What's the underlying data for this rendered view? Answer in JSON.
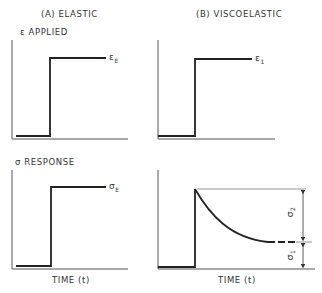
{
  "columns": {
    "elastic": {
      "title": "(A) ELASTIC"
    },
    "viscoelastic": {
      "title": "(B) VISCOELASTIC"
    }
  },
  "rows": {
    "applied": {
      "label": "ε APPLIED"
    },
    "response": {
      "label": "σ RESPONSE"
    }
  },
  "annotations": {
    "eps_E": {
      "sym": "ε",
      "sub": "E"
    },
    "eps_1": {
      "sym": "ε",
      "sub": "1"
    },
    "sigma_E": {
      "sym": "σ",
      "sub": "E"
    },
    "sigma_1": {
      "sym": "σ",
      "sub": "1"
    },
    "sigma_2": {
      "sym": "σ",
      "sub": "2"
    }
  },
  "axes": {
    "x_label": "TIME (t)"
  },
  "colors": {
    "line": "#222222",
    "axis": "#555555"
  }
}
